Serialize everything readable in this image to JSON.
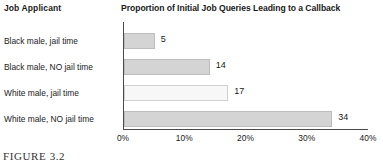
{
  "header": {
    "category_column_label": "Job Applicant"
  },
  "caption": {
    "label": "FIGURE 3.2"
  },
  "chart_data": {
    "type": "bar",
    "orientation": "horizontal",
    "title": "Proportion of Initial Job Queries Leading to a Callback",
    "xlabel": "",
    "ylabel": "Job Applicant",
    "categories": [
      "Black male, jail time",
      "Black male, NO jail time",
      "White male, jail time",
      "White male, NO jail time"
    ],
    "values": [
      5,
      14,
      17,
      34
    ],
    "value_labels": [
      "5",
      "14",
      "17",
      "34"
    ],
    "xlim": [
      0,
      40
    ],
    "xticks": [
      0,
      10,
      20,
      30,
      40
    ],
    "xtick_labels": [
      "0%",
      "10%",
      "20%",
      "30%",
      "40%"
    ],
    "grid": false,
    "legend": "none",
    "bar_colors": [
      "#d4d4d4",
      "#d4d4d4",
      "#f7f7f7",
      "#d4d4d4"
    ],
    "bar_border_color": "#c9c9c9",
    "axis_color": "#4a4a4a",
    "background": "#ffffff"
  }
}
